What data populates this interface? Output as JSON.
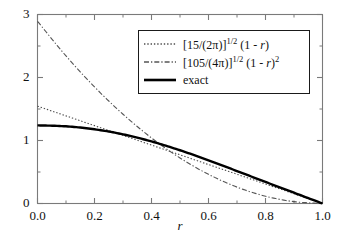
{
  "chart_data": {
    "type": "line",
    "title": "",
    "xlabel": "r",
    "ylabel": "",
    "xlim": [
      0.0,
      1.0
    ],
    "ylim": [
      0.0,
      3.0
    ],
    "grid": false,
    "legend_position": "top-right",
    "x_ticks": [
      "0.0",
      "0.2",
      "0.4",
      "0.6",
      "0.8",
      "1.0"
    ],
    "x_tick_values": [
      0.0,
      0.2,
      0.4,
      0.6,
      0.8,
      1.0
    ],
    "x_minor_step": 0.1,
    "y_ticks": [
      "0",
      "1",
      "2",
      "3"
    ],
    "y_tick_values": [
      0,
      1,
      2,
      3
    ],
    "y_minor_step": 0.5,
    "series": [
      {
        "name": "[15/(2π)]^(1/2) (1 - r)",
        "style": "dotted",
        "color": "#4d4d4d",
        "width": 1.1,
        "x": [
          0.0,
          0.1,
          0.2,
          0.3,
          0.4,
          0.5,
          0.6,
          0.7,
          0.8,
          0.9,
          1.0
        ],
        "values": [
          1.545,
          1.391,
          1.236,
          1.082,
          0.927,
          0.773,
          0.618,
          0.464,
          0.309,
          0.155,
          0.0
        ]
      },
      {
        "name": "[105/(4π)]^(1/2) (1 - r)^2",
        "style": "dashdot",
        "color": "#555555",
        "width": 1.1,
        "x": [
          0.0,
          0.1,
          0.2,
          0.3,
          0.4,
          0.5,
          0.6,
          0.7,
          0.8,
          0.9,
          1.0
        ],
        "values": [
          2.892,
          2.342,
          1.851,
          1.417,
          1.041,
          0.723,
          0.463,
          0.26,
          0.116,
          0.029,
          0.0
        ]
      },
      {
        "name": "exact",
        "style": "solid",
        "color": "#000000",
        "width": 2.4,
        "x": [
          0.0,
          0.1,
          0.2,
          0.3,
          0.4,
          0.5,
          0.6,
          0.7,
          0.8,
          0.9,
          1.0
        ],
        "values": [
          1.24,
          1.225,
          1.178,
          1.098,
          0.985,
          0.845,
          0.686,
          0.515,
          0.342,
          0.171,
          0.0
        ]
      }
    ]
  },
  "legend": {
    "entries": [
      {
        "key": "dotted-line-key",
        "prefix": "[15/(2π)]",
        "sup": "1/2",
        "suffix": " (1 - ",
        "var": "r",
        "tail": ")",
        "tail_sup": ""
      },
      {
        "key": "dashdot-line-key",
        "prefix": "[105/(4π)]",
        "sup": "1/2",
        "suffix": " (1 - ",
        "var": "r",
        "tail": ")",
        "tail_sup": "2"
      },
      {
        "key": "solid-line-key",
        "prefix": "exact",
        "sup": "",
        "suffix": "",
        "var": "",
        "tail": "",
        "tail_sup": ""
      }
    ]
  },
  "axes": {
    "x_title": "r",
    "y_tick_0": "0",
    "y_tick_1": "1",
    "y_tick_2": "2",
    "y_tick_3": "3",
    "x_tick_0": "0.0",
    "x_tick_1": "0.2",
    "x_tick_2": "0.4",
    "x_tick_3": "0.6",
    "x_tick_4": "0.8",
    "x_tick_5": "1.0"
  },
  "colors": {
    "frame": "#7a7a7a",
    "exact": "#000000",
    "approx1": "#4d4d4d",
    "approx2": "#555555",
    "legend_border": "#1a1a1a",
    "background": "#ffffff"
  }
}
